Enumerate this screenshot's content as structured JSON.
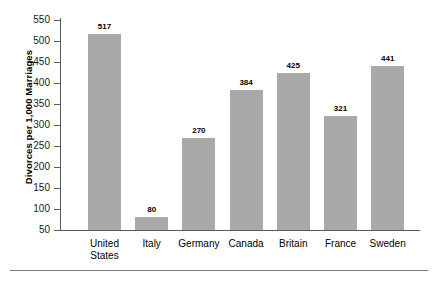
{
  "chart_data": {
    "type": "bar",
    "title": "",
    "subtitle": "",
    "xlabel": "",
    "ylabel": "Divorces per 1,000 Marriages",
    "categories": [
      "United States",
      "Italy",
      "Germany",
      "Canada",
      "Britain",
      "France",
      "Sweden"
    ],
    "category_lines": [
      [
        "United",
        "States"
      ],
      [
        "Italy"
      ],
      [
        "Germany"
      ],
      [
        "Canada"
      ],
      [
        "Britain"
      ],
      [
        "France"
      ],
      [
        "Sweden"
      ]
    ],
    "values": [
      517,
      80,
      270,
      384,
      425,
      321,
      441
    ],
    "value_labels": [
      "517",
      "80",
      "270",
      "384",
      "425",
      "321",
      "441"
    ],
    "ylim": [
      50,
      550
    ],
    "ytick_step": 50,
    "yticks": [
      50,
      100,
      150,
      200,
      250,
      300,
      350,
      400,
      450,
      500,
      550
    ],
    "ytick_labels": [
      "50",
      "100",
      "150",
      "200",
      "250",
      "300",
      "350",
      "400",
      "450",
      "500",
      "550"
    ],
    "grid": false,
    "legend": null,
    "bar_color": "#a9a9a9",
    "axis_color": "#5a5a5a",
    "text_color": "#000000"
  }
}
